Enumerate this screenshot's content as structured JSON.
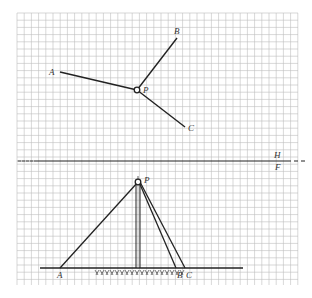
{
  "diagram": {
    "type": "orthographic-projection",
    "grid": {
      "x0": 17,
      "y0": 13,
      "x1": 298,
      "y1": 285,
      "cell": 7.2,
      "color": "#bdbdbd"
    },
    "fold_line": {
      "y": 161,
      "label_top": "H",
      "label_bottom": "F"
    },
    "top_view": {
      "P": {
        "x": 137,
        "y": 90,
        "label": "P"
      },
      "A": {
        "x": 60,
        "y": 72,
        "label": "A"
      },
      "B": {
        "x": 177,
        "y": 38,
        "label": "B"
      },
      "C": {
        "x": 185,
        "y": 127,
        "label": "C"
      }
    },
    "front_view": {
      "P": {
        "x": 138,
        "y": 182,
        "label": "P"
      },
      "ground_y": 268,
      "A": {
        "x": 60,
        "label": "A"
      },
      "B": {
        "x": 176,
        "label": "B"
      },
      "C": {
        "x": 185,
        "label": "C"
      }
    },
    "line_color": "#222222"
  }
}
